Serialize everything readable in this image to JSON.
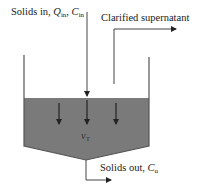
{
  "diagram": {
    "labels": {
      "inlet": {
        "text": "Solids in, ",
        "q": "Q",
        "q_sub": "in",
        "sep": ", ",
        "c": "C",
        "c_sub": "in"
      },
      "supernatant": {
        "text": "Clarified supernatant"
      },
      "settling_velocity": {
        "symbol": "v",
        "sub": "T"
      },
      "outlet": {
        "text": "Solids out, ",
        "c": "C",
        "c_sub": "u"
      }
    },
    "colors": {
      "sludge_fill": "#7a7a7a",
      "line": "#333333",
      "background": "#ffffff"
    },
    "arrows": {
      "settling_count": 3
    }
  }
}
